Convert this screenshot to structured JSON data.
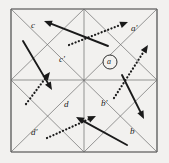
{
  "figure": {
    "type": "geometric-vector-diagram",
    "background_color": "#f2f1ef",
    "ink_color": "#1a1a1a",
    "grid_color": "#6b6b6b",
    "border_color": "#3a3a3a",
    "square": {
      "x": 11,
      "y": 9,
      "width": 146,
      "height": 143
    }
  },
  "labels": [
    {
      "id": "label-c",
      "text": "c",
      "x": 31,
      "y": 21
    },
    {
      "id": "label-c-prime",
      "text": "c'",
      "x": 59,
      "y": 55
    },
    {
      "id": "label-a-prime",
      "text": "a'",
      "x": 131,
      "y": 24
    },
    {
      "id": "label-a-circled",
      "text": "a",
      "x": 107,
      "y": 58
    },
    {
      "id": "label-d",
      "text": "d",
      "x": 64,
      "y": 100
    },
    {
      "id": "label-b-prime",
      "text": "b'",
      "x": 101,
      "y": 99
    },
    {
      "id": "label-d-prime",
      "text": "d'",
      "x": 31,
      "y": 128
    },
    {
      "id": "label-b",
      "text": "b",
      "x": 130,
      "y": 127
    }
  ],
  "circle_marker": {
    "id": "circle-a-marker",
    "cx": 110,
    "cy": 62,
    "r": 7
  },
  "grid_lines": [
    {
      "id": "square-top",
      "x1": 11,
      "y1": 9,
      "x2": 157,
      "y2": 9
    },
    {
      "id": "square-right",
      "x1": 157,
      "y1": 9,
      "x2": 157,
      "y2": 152
    },
    {
      "id": "square-bottom",
      "x1": 11,
      "y1": 152,
      "x2": 157,
      "y2": 152
    },
    {
      "id": "square-left",
      "x1": 11,
      "y1": 9,
      "x2": 11,
      "y2": 152
    },
    {
      "id": "diagonal-tl-br",
      "x1": 11,
      "y1": 9,
      "x2": 157,
      "y2": 152
    },
    {
      "id": "diagonal-tr-bl",
      "x1": 157,
      "y1": 9,
      "x2": 11,
      "y2": 152
    },
    {
      "id": "midline-horizontal",
      "x1": 11,
      "y1": 80,
      "x2": 157,
      "y2": 80
    },
    {
      "id": "midline-vertical",
      "x1": 84,
      "y1": 9,
      "x2": 84,
      "y2": 152
    },
    {
      "id": "diag-top-left-mid",
      "x1": 11,
      "y1": 80,
      "x2": 84,
      "y2": 9
    },
    {
      "id": "diag-top-right-mid",
      "x1": 84,
      "y1": 9,
      "x2": 157,
      "y2": 80
    },
    {
      "id": "diag-bot-left-mid",
      "x1": 11,
      "y1": 80,
      "x2": 84,
      "y2": 152
    },
    {
      "id": "diag-bot-right-mid",
      "x1": 84,
      "y1": 152,
      "x2": 157,
      "y2": 80
    }
  ],
  "arrows": [
    {
      "id": "arrow-solid-upper-left",
      "style": "solid",
      "x1": 108,
      "y1": 46,
      "x2": 44,
      "y2": 21
    },
    {
      "id": "arrow-dotted-upper-right",
      "style": "dotted",
      "x1": 69,
      "y1": 45,
      "x2": 128,
      "y2": 22
    },
    {
      "id": "arrow-solid-left-down",
      "style": "solid",
      "x1": 23,
      "y1": 41,
      "x2": 52,
      "y2": 90
    },
    {
      "id": "arrow-dotted-left-up",
      "style": "dotted",
      "x1": 26,
      "y1": 104,
      "x2": 50,
      "y2": 72
    },
    {
      "id": "arrow-dotted-right-up",
      "style": "dotted",
      "x1": 114,
      "y1": 98,
      "x2": 148,
      "y2": 45
    },
    {
      "id": "arrow-solid-right-down",
      "style": "solid",
      "x1": 122,
      "y1": 75,
      "x2": 144,
      "y2": 119
    },
    {
      "id": "arrow-solid-lower-left",
      "style": "solid",
      "x1": 127,
      "y1": 145,
      "x2": 76,
      "y2": 117
    },
    {
      "id": "arrow-dotted-lower-right",
      "style": "dotted",
      "x1": 47,
      "y1": 138,
      "x2": 96,
      "y2": 116
    }
  ]
}
